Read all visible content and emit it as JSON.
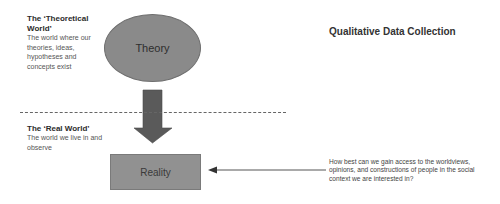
{
  "title": "Qualitative Data Collection",
  "theoretical_world": {
    "heading": "The ‘Theoretical World’",
    "description": "The world where our theories, ideas, hypotheses and concepts exist"
  },
  "real_world": {
    "heading": "The ‘Real World’",
    "description": "The world we live in and observe"
  },
  "nodes": {
    "theory": "Theory",
    "reality": "Reality"
  },
  "question": "How best can we gain access to the worldviews, opinions, and constructions of people in the social context we are interested in?",
  "colors": {
    "shape_fill": "#8a8a8a",
    "arrow_fill": "#5a5a5a",
    "line": "#555555"
  }
}
